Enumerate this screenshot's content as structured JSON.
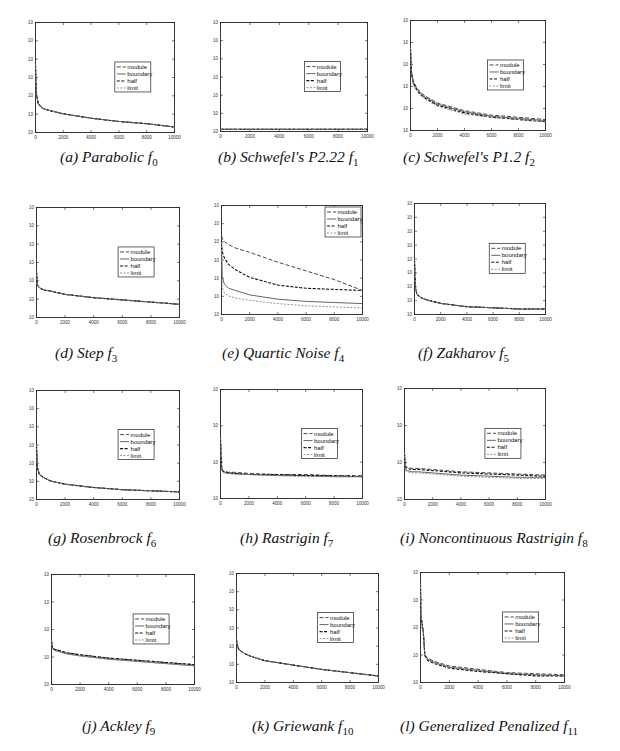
{
  "figure": {
    "legend_labels": [
      "module",
      "boundary",
      "half",
      "limit"
    ],
    "x_ticks": [
      "0",
      "2000",
      "4000",
      "6000",
      "8000",
      "10000"
    ]
  },
  "panels": [
    {
      "id": "a",
      "caption": "(a) Parabolic  f",
      "subscript": "0"
    },
    {
      "id": "b",
      "caption": "(b) Schwefel's P2.22  f",
      "subscript": "1"
    },
    {
      "id": "c",
      "caption": "(c) Schwefel's P1.2  f",
      "subscript": "2"
    },
    {
      "id": "d",
      "caption": "(d) Step  f",
      "subscript": "3"
    },
    {
      "id": "e",
      "caption": "(e) Quartic Noise  f",
      "subscript": "4"
    },
    {
      "id": "f",
      "caption": "(f) Zakharov  f",
      "subscript": "5"
    },
    {
      "id": "g",
      "caption": "(g) Rosenbrock  f",
      "subscript": "6"
    },
    {
      "id": "h",
      "caption": "(h) Rastrigin  f",
      "subscript": "7"
    },
    {
      "id": "i",
      "caption": "(i) Noncontinuous Rastrigin  f",
      "subscript": "8"
    },
    {
      "id": "j",
      "caption": "(j) Ackley  f",
      "subscript": "9"
    },
    {
      "id": "k",
      "caption": "(k) Griewank  f",
      "subscript": "10"
    },
    {
      "id": "l",
      "caption": "(l) Generalized Penalized  f",
      "subscript": "11"
    }
  ],
  "chart_data": [
    {
      "panel": "a",
      "type": "line",
      "title": "(a) Parabolic f0",
      "xlabel": "",
      "ylabel": "",
      "xlim": [
        0,
        10000
      ],
      "yscale": "log",
      "y_tick_count": 7,
      "x": [
        0,
        50,
        200,
        500,
        1000,
        2000,
        4000,
        6000,
        8000,
        10000
      ],
      "series": [
        {
          "name": "module",
          "values_frac": [
            0.62,
            0.35,
            0.26,
            0.22,
            0.2,
            0.17,
            0.13,
            0.1,
            0.08,
            0.05
          ]
        },
        {
          "name": "boundary",
          "values_frac": [
            0.62,
            0.35,
            0.26,
            0.22,
            0.2,
            0.17,
            0.13,
            0.1,
            0.08,
            0.05
          ]
        },
        {
          "name": "half",
          "values_frac": [
            0.62,
            0.35,
            0.26,
            0.22,
            0.2,
            0.17,
            0.13,
            0.1,
            0.08,
            0.05
          ]
        },
        {
          "name": "limit",
          "values_frac": [
            0.62,
            0.35,
            0.26,
            0.22,
            0.2,
            0.17,
            0.13,
            0.1,
            0.08,
            0.05
          ]
        }
      ],
      "legend_position": "center-right"
    },
    {
      "panel": "b",
      "type": "line",
      "title": "(b) Schwefel's P2.22 f1",
      "xlim": [
        0,
        10000
      ],
      "yscale": "log",
      "y_tick_count": 7,
      "x": [
        0,
        10000
      ],
      "series": [
        {
          "name": "module",
          "values_frac": [
            0.02,
            0.02
          ]
        },
        {
          "name": "boundary",
          "values_frac": [
            0.02,
            0.02
          ]
        },
        {
          "name": "half",
          "values_frac": [
            0.02,
            0.02
          ]
        },
        {
          "name": "limit",
          "values_frac": [
            0.02,
            0.02
          ]
        }
      ],
      "legend_position": "center-right"
    },
    {
      "panel": "c",
      "type": "line",
      "title": "(c) Schwefel's P1.2 f2",
      "xlim": [
        0,
        10000
      ],
      "yscale": "log",
      "y_tick_count": 6,
      "x": [
        0,
        50,
        200,
        500,
        1000,
        2000,
        4000,
        6000,
        8000,
        10000
      ],
      "series": [
        {
          "name": "module",
          "values_frac": [
            0.75,
            0.55,
            0.45,
            0.38,
            0.32,
            0.25,
            0.18,
            0.14,
            0.12,
            0.1
          ]
        },
        {
          "name": "boundary",
          "values_frac": [
            0.75,
            0.54,
            0.44,
            0.37,
            0.31,
            0.24,
            0.17,
            0.13,
            0.11,
            0.09
          ]
        },
        {
          "name": "half",
          "values_frac": [
            0.75,
            0.53,
            0.43,
            0.36,
            0.3,
            0.23,
            0.16,
            0.12,
            0.1,
            0.08
          ]
        },
        {
          "name": "limit",
          "values_frac": [
            0.75,
            0.52,
            0.42,
            0.35,
            0.29,
            0.22,
            0.15,
            0.12,
            0.1,
            0.08
          ]
        }
      ],
      "legend_position": "center-right"
    },
    {
      "panel": "d",
      "type": "line",
      "title": "(d) Step f3",
      "xlim": [
        0,
        10000
      ],
      "yscale": "log",
      "y_tick_count": 7,
      "x": [
        0,
        50,
        200,
        500,
        1000,
        2000,
        4000,
        6000,
        8000,
        10000
      ],
      "series": [
        {
          "name": "module",
          "values_frac": [
            0.42,
            0.3,
            0.27,
            0.25,
            0.24,
            0.21,
            0.18,
            0.16,
            0.14,
            0.12
          ]
        },
        {
          "name": "boundary",
          "values_frac": [
            0.42,
            0.3,
            0.27,
            0.25,
            0.24,
            0.21,
            0.18,
            0.16,
            0.14,
            0.12
          ]
        },
        {
          "name": "half",
          "values_frac": [
            0.42,
            0.3,
            0.27,
            0.25,
            0.24,
            0.21,
            0.18,
            0.16,
            0.14,
            0.12
          ]
        },
        {
          "name": "limit",
          "values_frac": [
            0.42,
            0.3,
            0.27,
            0.25,
            0.24,
            0.21,
            0.18,
            0.16,
            0.14,
            0.12
          ]
        }
      ],
      "legend_position": "center-right"
    },
    {
      "panel": "e",
      "type": "line",
      "title": "(e) Quartic Noise f4",
      "xlim": [
        0,
        10000
      ],
      "yscale": "log",
      "y_tick_count": 7,
      "x": [
        0,
        50,
        200,
        500,
        1000,
        2000,
        4000,
        6000,
        8000,
        10000
      ],
      "series": [
        {
          "name": "module",
          "values_frac": [
            0.72,
            0.7,
            0.67,
            0.64,
            0.61,
            0.57,
            0.48,
            0.4,
            0.32,
            0.22
          ]
        },
        {
          "name": "boundary",
          "values_frac": [
            0.66,
            0.35,
            0.28,
            0.24,
            0.22,
            0.18,
            0.14,
            0.12,
            0.11,
            0.1
          ]
        },
        {
          "name": "half",
          "values_frac": [
            0.66,
            0.58,
            0.52,
            0.46,
            0.41,
            0.34,
            0.27,
            0.24,
            0.23,
            0.22
          ]
        },
        {
          "name": "limit",
          "values_frac": [
            0.66,
            0.25,
            0.2,
            0.17,
            0.15,
            0.13,
            0.1,
            0.08,
            0.07,
            0.06
          ]
        }
      ],
      "legend_position": "upper-right"
    },
    {
      "panel": "f",
      "type": "line",
      "title": "(f) Zakharov f5",
      "xlim": [
        0,
        10000
      ],
      "yscale": "log",
      "y_tick_count": 9,
      "x": [
        0,
        50,
        200,
        500,
        1000,
        2000,
        4000,
        6000,
        8000,
        10000
      ],
      "series": [
        {
          "name": "module",
          "values_frac": [
            0.5,
            0.25,
            0.18,
            0.15,
            0.13,
            0.1,
            0.07,
            0.06,
            0.05,
            0.05
          ]
        },
        {
          "name": "boundary",
          "values_frac": [
            0.5,
            0.25,
            0.18,
            0.15,
            0.13,
            0.1,
            0.07,
            0.06,
            0.05,
            0.05
          ]
        },
        {
          "name": "half",
          "values_frac": [
            0.5,
            0.25,
            0.18,
            0.15,
            0.13,
            0.1,
            0.07,
            0.06,
            0.05,
            0.05
          ]
        },
        {
          "name": "limit",
          "values_frac": [
            0.5,
            0.25,
            0.18,
            0.15,
            0.13,
            0.1,
            0.07,
            0.06,
            0.05,
            0.05
          ]
        }
      ],
      "legend_position": "center-right"
    },
    {
      "panel": "g",
      "type": "line",
      "title": "(g) Rosenbrock f6",
      "xlim": [
        0,
        10000
      ],
      "yscale": "log",
      "y_tick_count": 7,
      "x": [
        0,
        50,
        200,
        500,
        1000,
        2000,
        4000,
        6000,
        8000,
        10000
      ],
      "series": [
        {
          "name": "module",
          "values_frac": [
            0.5,
            0.3,
            0.23,
            0.2,
            0.17,
            0.14,
            0.11,
            0.09,
            0.08,
            0.07
          ]
        },
        {
          "name": "boundary",
          "values_frac": [
            0.5,
            0.3,
            0.23,
            0.2,
            0.17,
            0.14,
            0.11,
            0.09,
            0.08,
            0.07
          ]
        },
        {
          "name": "half",
          "values_frac": [
            0.5,
            0.3,
            0.23,
            0.2,
            0.17,
            0.14,
            0.11,
            0.09,
            0.08,
            0.07
          ]
        },
        {
          "name": "limit",
          "values_frac": [
            0.5,
            0.3,
            0.23,
            0.2,
            0.17,
            0.14,
            0.11,
            0.09,
            0.08,
            0.07
          ]
        }
      ],
      "legend_position": "center-right"
    },
    {
      "panel": "h",
      "type": "line",
      "title": "(h) Rastrigin f7",
      "xlim": [
        0,
        10000
      ],
      "yscale": "log",
      "y_tick_count": 4,
      "x": [
        0,
        50,
        100,
        200,
        500,
        1000,
        2000,
        4000,
        6000,
        8000,
        10000
      ],
      "series": [
        {
          "name": "module",
          "values_frac": [
            0.55,
            0.35,
            0.27,
            0.25,
            0.24,
            0.24,
            0.23,
            0.22,
            0.22,
            0.21,
            0.21
          ]
        },
        {
          "name": "boundary",
          "values_frac": [
            0.55,
            0.34,
            0.26,
            0.24,
            0.23,
            0.23,
            0.22,
            0.21,
            0.21,
            0.2,
            0.2
          ]
        },
        {
          "name": "half",
          "values_frac": [
            0.55,
            0.35,
            0.27,
            0.25,
            0.24,
            0.23,
            0.22,
            0.22,
            0.21,
            0.21,
            0.2
          ]
        },
        {
          "name": "limit",
          "values_frac": [
            0.55,
            0.33,
            0.26,
            0.24,
            0.23,
            0.22,
            0.22,
            0.21,
            0.2,
            0.2,
            0.2
          ]
        }
      ],
      "legend_position": "center-right"
    },
    {
      "panel": "i",
      "type": "line",
      "title": "(i) Noncontinuous Rastrigin f8",
      "xlim": [
        0,
        10000
      ],
      "yscale": "log",
      "y_tick_count": 4,
      "x": [
        0,
        50,
        200,
        500,
        1000,
        2000,
        4000,
        6000,
        8000,
        10000
      ],
      "series": [
        {
          "name": "module",
          "values_frac": [
            0.42,
            0.3,
            0.29,
            0.28,
            0.28,
            0.27,
            0.25,
            0.24,
            0.23,
            0.22
          ]
        },
        {
          "name": "boundary",
          "values_frac": [
            0.42,
            0.27,
            0.26,
            0.25,
            0.25,
            0.24,
            0.22,
            0.21,
            0.2,
            0.2
          ]
        },
        {
          "name": "half",
          "values_frac": [
            0.42,
            0.29,
            0.28,
            0.27,
            0.27,
            0.26,
            0.24,
            0.23,
            0.22,
            0.21
          ]
        },
        {
          "name": "limit",
          "values_frac": [
            0.42,
            0.26,
            0.25,
            0.24,
            0.24,
            0.23,
            0.21,
            0.2,
            0.19,
            0.19
          ]
        }
      ],
      "legend_position": "center-right"
    },
    {
      "panel": "j",
      "type": "line",
      "title": "(j) Ackley f9",
      "xlim": [
        0,
        10000
      ],
      "yscale": "log",
      "y_tick_count": 5,
      "x": [
        0,
        50,
        200,
        500,
        1000,
        2000,
        4000,
        6000,
        8000,
        10000
      ],
      "series": [
        {
          "name": "module",
          "values_frac": [
            0.4,
            0.34,
            0.32,
            0.31,
            0.29,
            0.27,
            0.24,
            0.22,
            0.2,
            0.18
          ]
        },
        {
          "name": "boundary",
          "values_frac": [
            0.4,
            0.33,
            0.31,
            0.3,
            0.28,
            0.26,
            0.23,
            0.21,
            0.19,
            0.17
          ]
        },
        {
          "name": "half",
          "values_frac": [
            0.4,
            0.34,
            0.32,
            0.31,
            0.29,
            0.27,
            0.24,
            0.22,
            0.2,
            0.18
          ]
        },
        {
          "name": "limit",
          "values_frac": [
            0.4,
            0.33,
            0.31,
            0.3,
            0.28,
            0.26,
            0.23,
            0.21,
            0.19,
            0.17
          ]
        }
      ],
      "legend_position": "center-right"
    },
    {
      "panel": "k",
      "type": "line",
      "title": "(k) Griewank f10",
      "xlim": [
        0,
        10000
      ],
      "yscale": "log",
      "y_tick_count": 7,
      "x": [
        0,
        50,
        200,
        500,
        1000,
        2000,
        4000,
        6000,
        8000,
        10000
      ],
      "series": [
        {
          "name": "module",
          "values_frac": [
            0.4,
            0.33,
            0.3,
            0.27,
            0.24,
            0.2,
            0.16,
            0.12,
            0.09,
            0.06
          ]
        },
        {
          "name": "boundary",
          "values_frac": [
            0.4,
            0.33,
            0.3,
            0.27,
            0.24,
            0.2,
            0.16,
            0.12,
            0.09,
            0.06
          ]
        },
        {
          "name": "half",
          "values_frac": [
            0.4,
            0.33,
            0.3,
            0.27,
            0.24,
            0.2,
            0.16,
            0.12,
            0.09,
            0.06
          ]
        },
        {
          "name": "limit",
          "values_frac": [
            0.4,
            0.33,
            0.3,
            0.27,
            0.24,
            0.2,
            0.16,
            0.12,
            0.09,
            0.06
          ]
        }
      ],
      "legend_position": "center-right"
    },
    {
      "panel": "l",
      "type": "line",
      "title": "(l) Generalized Penalized f11",
      "xlim": [
        0,
        10000
      ],
      "yscale": "log",
      "y_tick_count": 5,
      "x": [
        0,
        30,
        100,
        200,
        300,
        500,
        1000,
        2000,
        4000,
        6000,
        8000,
        10000
      ],
      "series": [
        {
          "name": "module",
          "values_frac": [
            0.9,
            0.6,
            0.55,
            0.45,
            0.25,
            0.22,
            0.19,
            0.15,
            0.12,
            0.09,
            0.08,
            0.07
          ]
        },
        {
          "name": "boundary",
          "values_frac": [
            0.9,
            0.6,
            0.55,
            0.45,
            0.24,
            0.21,
            0.18,
            0.14,
            0.11,
            0.08,
            0.07,
            0.06
          ]
        },
        {
          "name": "half",
          "values_frac": [
            0.9,
            0.6,
            0.55,
            0.45,
            0.25,
            0.2,
            0.17,
            0.13,
            0.1,
            0.08,
            0.06,
            0.06
          ]
        },
        {
          "name": "limit",
          "values_frac": [
            0.9,
            0.6,
            0.55,
            0.45,
            0.24,
            0.21,
            0.18,
            0.14,
            0.11,
            0.09,
            0.07,
            0.06
          ]
        }
      ],
      "legend_position": "center-right"
    }
  ]
}
